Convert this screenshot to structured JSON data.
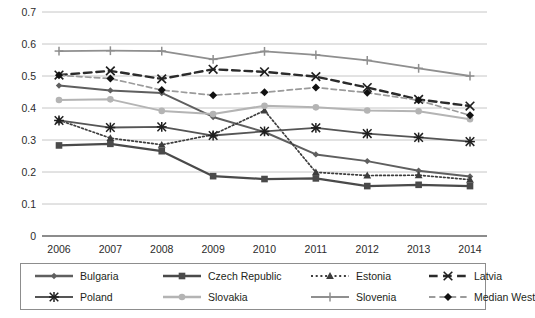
{
  "chart_data": {
    "type": "line",
    "title": "",
    "subtitle": "",
    "xlabel": "",
    "ylabel": "",
    "categories": [
      "2006",
      "2007",
      "2008",
      "2009",
      "2010",
      "2011",
      "2012",
      "2013",
      "2014"
    ],
    "x": [
      2006,
      2007,
      2008,
      2009,
      2010,
      2011,
      2012,
      2013,
      2014
    ],
    "ylim": [
      0,
      0.7
    ],
    "ytick_labels": [
      "0.7",
      "0.6",
      "0.5",
      "0.4",
      "0.3",
      "0.2",
      "0.1",
      "0"
    ],
    "ytick_values": [
      0.7,
      0.6,
      0.5,
      0.4,
      0.3,
      0.2,
      0.1,
      0
    ],
    "grid": "horizontal",
    "legend_position": "bottom",
    "legend_columns": 4,
    "legend_rows": 2,
    "series": [
      {
        "name": "Bulgaria",
        "marker": "diamond",
        "linestyle": "solid",
        "color": "#5f5f5f",
        "values": [
          0.47,
          0.455,
          0.447,
          0.372,
          0.325,
          0.255,
          0.234,
          0.204,
          0.186
        ]
      },
      {
        "name": "Czech Republic",
        "marker": "square",
        "linestyle": "solid",
        "color": "#4a4a4a",
        "values": [
          0.283,
          0.288,
          0.265,
          0.187,
          0.178,
          0.18,
          0.156,
          0.16,
          0.156
        ]
      },
      {
        "name": "Estonia",
        "marker": "triangle",
        "linestyle": "dotted",
        "color": "#3d3d3d",
        "values": [
          0.362,
          0.306,
          0.285,
          0.317,
          0.392,
          0.199,
          0.189,
          0.19,
          0.176
        ]
      },
      {
        "name": "Latvia",
        "marker": "x",
        "linestyle": "dashed",
        "color": "#2b2b2b",
        "values": [
          0.503,
          0.516,
          0.491,
          0.521,
          0.513,
          0.498,
          0.464,
          0.427,
          0.406
        ]
      },
      {
        "name": "Poland",
        "marker": "asterisk",
        "linestyle": "solid",
        "color": "#555555",
        "values": [
          0.361,
          0.339,
          0.341,
          0.314,
          0.327,
          0.338,
          0.32,
          0.308,
          0.295
        ]
      },
      {
        "name": "Slovakia",
        "marker": "circle",
        "linestyle": "solid",
        "color": "#b4b4b4",
        "values": [
          0.425,
          0.427,
          0.391,
          0.381,
          0.407,
          0.402,
          0.392,
          0.39,
          0.365
        ]
      },
      {
        "name": "Slovenia",
        "marker": "plus",
        "linestyle": "solid",
        "color": "#8f8f8f",
        "values": [
          0.578,
          0.579,
          0.578,
          0.552,
          0.577,
          0.566,
          0.549,
          0.524,
          0.5
        ]
      },
      {
        "name": "Median West",
        "marker": "filled-diamond",
        "linestyle": "dashed",
        "color": "#9b9b9b",
        "values": [
          0.502,
          0.492,
          0.456,
          0.44,
          0.449,
          0.464,
          0.448,
          0.424,
          0.377
        ]
      }
    ]
  },
  "legend": {
    "items": [
      {
        "label": "Bulgaria"
      },
      {
        "label": "Czech Republic"
      },
      {
        "label": "Estonia"
      },
      {
        "label": "Latvia"
      },
      {
        "label": "Poland"
      },
      {
        "label": "Slovakia"
      },
      {
        "label": "Slovenia"
      },
      {
        "label": "Median West"
      }
    ]
  },
  "axes": {
    "y_labels": [
      "0.7",
      "0.6",
      "0.5",
      "0.4",
      "0.3",
      "0.2",
      "0.1",
      "0"
    ],
    "x_labels": [
      "2006",
      "2007",
      "2008",
      "2009",
      "2010",
      "2011",
      "2012",
      "2013",
      "2014"
    ]
  },
  "colors": {
    "grid": "#bfbfbf",
    "axis": "#7a7a7a",
    "text": "#231f20",
    "legend_border": "#8d8d8d",
    "background": "#ffffff"
  }
}
